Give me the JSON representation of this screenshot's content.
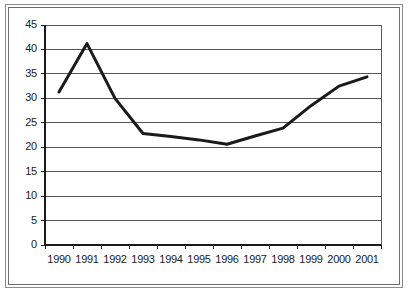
{
  "figure": {
    "background_color": "#ffffff",
    "frame_color": "#7a7a7a"
  },
  "chart_data": {
    "type": "line",
    "title": "",
    "subtitle": "",
    "xlabel": "",
    "ylabel": "",
    "x": [
      "1990",
      "1991",
      "1992",
      "1993",
      "1994",
      "1995",
      "1996",
      "1997",
      "1998",
      "1999",
      "2000",
      "2001"
    ],
    "categories": [
      "1990",
      "1991",
      "1992",
      "1993",
      "1994",
      "1995",
      "1996",
      "1997",
      "1998",
      "1999",
      "2000",
      "2001"
    ],
    "values": [
      31.3,
      41.2,
      30.0,
      22.8,
      22.2,
      21.5,
      20.6,
      22.3,
      23.9,
      28.5,
      32.5,
      34.4
    ],
    "series": [
      {
        "name": "series-1",
        "values": [
          31.3,
          41.2,
          30.0,
          22.8,
          22.2,
          21.5,
          20.6,
          22.3,
          23.9,
          28.5,
          32.5,
          34.4
        ],
        "color": "#1a1a1a",
        "line_width": 3
      }
    ],
    "ylim": [
      0,
      45
    ],
    "yticks": [
      0,
      5,
      10,
      15,
      20,
      25,
      30,
      35,
      40,
      45
    ],
    "ytick_labels": [
      "0",
      "5",
      "10",
      "15",
      "20",
      "25",
      "30",
      "35",
      "40",
      "45"
    ],
    "xtick_labels": [
      "1990",
      "1991",
      "1992",
      "1993",
      "1994",
      "1995",
      "1996",
      "1997",
      "1998",
      "1999",
      "2000",
      "2001"
    ],
    "grid": {
      "horizontal": true,
      "vertical": false,
      "color": "#555555"
    },
    "legend": {
      "visible": false,
      "position": "none",
      "entries": []
    },
    "markers": false,
    "annotations": []
  }
}
